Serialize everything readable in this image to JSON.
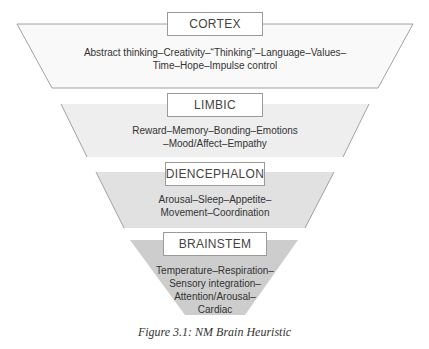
{
  "figure": {
    "caption": "Figure 3.1: NM Brain Heuristic",
    "levels": [
      {
        "name": "CORTEX",
        "fill": "#f9f9f9",
        "lines": [
          "Abstract thinking–Creativity–“Thinking”–Language–Values–",
          "Time–Hope–Impulse control"
        ]
      },
      {
        "name": "LIMBIC",
        "fill": "#efefef",
        "lines": [
          "Reward–Memory–Bonding–Emotions",
          "–Mood/Affect–Empathy"
        ]
      },
      {
        "name": "DIENCEPHALON",
        "fill": "#e2e2e2",
        "lines": [
          "Arousal–Sleep–Appetite–",
          "Movement–Coordination"
        ]
      },
      {
        "name": "BRAINSTEM",
        "fill": "#cfcfcf",
        "lines": [
          "Temperature–Respiration–",
          "Sensory integration–",
          "Attention/Arousal–",
          "Cardiac"
        ]
      }
    ]
  }
}
